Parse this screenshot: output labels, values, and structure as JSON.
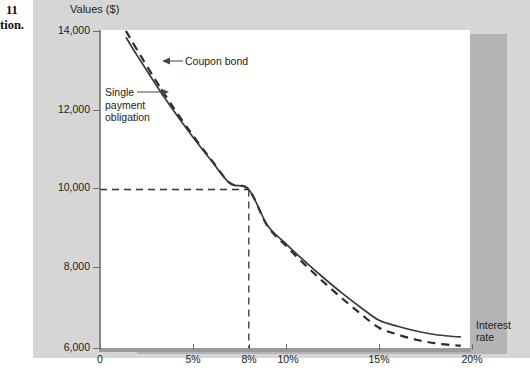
{
  "page_margin": {
    "line1": "11",
    "line2": "tion."
  },
  "chart_data": {
    "type": "line",
    "title": "",
    "ylabel": "Values ($)",
    "xlabel": "Interest rate",
    "xlabel_line1": "Interest",
    "xlabel_line2": "rate",
    "xlim": [
      0,
      20
    ],
    "ylim": [
      6000,
      14000
    ],
    "grid": false,
    "legend": "annotations",
    "xtick_labels": [
      "0",
      "5%",
      "8%",
      "10%",
      "15%",
      "20%"
    ],
    "xtick_values": [
      0,
      5,
      8,
      10,
      15,
      20
    ],
    "ytick_labels": [
      "14,000",
      "12,000",
      "10,000",
      "8,000",
      "6,000"
    ],
    "ytick_values": [
      14000,
      12000,
      10000,
      8000,
      6000
    ],
    "series": [
      {
        "name": "Coupon bond",
        "style": "solid",
        "color": "#3a3a3a",
        "x": [
          1.4,
          2,
          3,
          4,
          5,
          6,
          7,
          8,
          9,
          10,
          11,
          12,
          13,
          14,
          15,
          16,
          17,
          18,
          19,
          19.4
        ],
        "values": [
          13840,
          13380,
          12650,
          11960,
          11320,
          10720,
          10150,
          10000,
          9100,
          8630,
          8190,
          7780,
          7390,
          7030,
          6700,
          6550,
          6430,
          6340,
          6290,
          6280
        ]
      },
      {
        "name": "Single payment obligation",
        "style": "dashed",
        "color": "#2b2b2b",
        "x": [
          1.4,
          2,
          3,
          4,
          5,
          6,
          7,
          8,
          9,
          10,
          11,
          12,
          13,
          14,
          15,
          16,
          17,
          18,
          19,
          19.4
        ],
        "values": [
          14000,
          13520,
          12750,
          12030,
          11360,
          10740,
          10160,
          10000,
          9080,
          8580,
          8110,
          7670,
          7260,
          6870,
          6510,
          6340,
          6210,
          6120,
          6070,
          6060
        ]
      }
    ],
    "tangency_point": {
      "x": 8,
      "y": 10000,
      "label": "8%",
      "value_label": "10,000"
    },
    "reference_lines": [
      {
        "orientation": "horizontal",
        "value": 10000,
        "style": "dashed",
        "from_x": 0,
        "to_x": 8
      },
      {
        "orientation": "vertical",
        "value": 8,
        "style": "dashed",
        "from_y": 6000,
        "to_y": 10000
      }
    ],
    "annotations": [
      {
        "name": "coupon-bond",
        "text": "Coupon bond",
        "arrow": "left"
      },
      {
        "name": "single-payment-obligation",
        "text": "Single payment obligation",
        "line1": "Single",
        "line2": "payment",
        "line3": "obligation",
        "arrow": "right"
      }
    ]
  },
  "colors": {
    "panel_background": "#d6d6d6",
    "plot_background": "#ffffff",
    "axis": "#8a8a8a",
    "curve_solid": "#3a3a3a",
    "curve_dashed": "#2b2b2b",
    "text": "#222222"
  }
}
